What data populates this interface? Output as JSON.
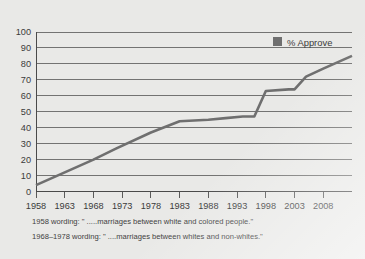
{
  "chart_data": {
    "type": "line",
    "title": "",
    "xlabel": "",
    "ylabel": "",
    "xlim": [
      1958,
      2013
    ],
    "ylim": [
      0,
      100
    ],
    "grid": true,
    "legend_position": "top-right",
    "series": [
      {
        "name": "% Approve",
        "color": "#6f6f6f",
        "x": [
          1958,
          1968,
          1972,
          1978,
          1983,
          1988,
          1991,
          1994,
          1996,
          1997,
          1998,
          2002,
          2003,
          2005,
          2008,
          2013
        ],
        "values": [
          4,
          20,
          27,
          37,
          44,
          45,
          46,
          47,
          47,
          55,
          63,
          64,
          64,
          72,
          77,
          85
        ]
      }
    ],
    "yticks": [
      0,
      10,
      20,
      30,
      40,
      50,
      60,
      70,
      80,
      90,
      100
    ],
    "ytick_labels": [
      "0",
      "10",
      "20",
      "30",
      "40",
      "50",
      "60",
      "70",
      "80",
      "90",
      "100"
    ],
    "xticks": [
      1958,
      1963,
      1968,
      1973,
      1978,
      1983,
      1988,
      1993,
      1998,
      2003,
      2008
    ],
    "xtick_labels": [
      "1958",
      "1963",
      "1968",
      "1973",
      "1978",
      "1983",
      "1988",
      "1993",
      "1998",
      "2003",
      "2008"
    ],
    "legend_entries": [
      {
        "label": "% Approve",
        "color": "#6f6f6f"
      }
    ],
    "annotations": [
      "1958 wording: \" .....marriages between white and colored people.\"",
      "1968–1978 wording: \" ....marriages between whites and non-whites.\""
    ]
  },
  "legend": {
    "entry_label": "% Approve"
  },
  "footnotes": {
    "line1": "1958 wording: \" .....marriages between white and colored people.\"",
    "line2": "1968–1978 wording: \" ....marriages between whites and non-whites.\""
  },
  "colors": {
    "background": "#e9e9e7",
    "series": "#6f6f6f",
    "grid": "#555555",
    "text": "#3b3b3b"
  }
}
